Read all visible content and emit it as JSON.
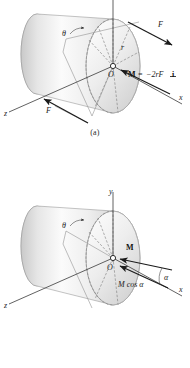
{
  "document": {
    "kind": "mechanics-figure",
    "title": "Moment of a couple acting on a cylinder"
  },
  "figures": [
    {
      "id": "a",
      "caption": "(a)",
      "axes": [
        {
          "name": "y",
          "label": "y",
          "visible_label": false
        },
        {
          "name": "x",
          "label": "x"
        },
        {
          "name": "z",
          "label": "z"
        }
      ],
      "labels": {
        "origin": "O",
        "theta": "θ",
        "radius": "r",
        "force_upper": "F",
        "force_lower": "F",
        "moment": "M",
        "moment_equals": "=",
        "moment_value": "−2rF",
        "moment_unit_vector": "i"
      }
    },
    {
      "id": "b",
      "caption": "(b)",
      "axes": [
        {
          "name": "y",
          "label": "y"
        },
        {
          "name": "x",
          "label": "x"
        },
        {
          "name": "z",
          "label": "z"
        }
      ],
      "labels": {
        "origin": "O",
        "theta": "θ",
        "moment": "M",
        "alpha": "α",
        "moment_component": "M cos α"
      }
    }
  ],
  "colors": {
    "background": "#ffffff",
    "ink": "#1b1b1b",
    "axis": "#3a3a3a",
    "dashed": "#7a7a7a",
    "cylinder_light": "#fdfdfd",
    "cylinder_mid": "#e2e2e2",
    "cylinder_dark": "#bdbdbd",
    "cylinder_edge": "#9b9b9b"
  }
}
